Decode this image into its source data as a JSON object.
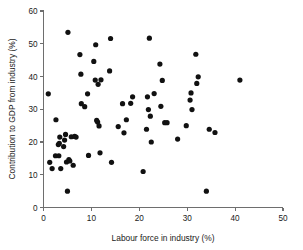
{
  "figure": {
    "background_color": "#ffffff",
    "point_color": "#111111",
    "axis_color": "#6e6e6e"
  },
  "chart_data": {
    "type": "scatter",
    "title": "",
    "xlabel": "Labour force in industry (%)",
    "ylabel": "Contribution to GDP from industry (%)",
    "xlim": [
      0,
      50
    ],
    "ylim": [
      0,
      60
    ],
    "xticks": [
      0,
      10,
      20,
      30,
      40,
      50
    ],
    "yticks": [
      0,
      10,
      20,
      30,
      40,
      50,
      60
    ],
    "xtick_labels": [
      "0",
      "10",
      "20",
      "30",
      "40",
      "50"
    ],
    "ytick_labels": [
      "0",
      "10",
      "20",
      "30",
      "40",
      "50",
      "60"
    ],
    "grid": false,
    "legend": null,
    "marker": "circle",
    "marker_size": 2.6,
    "series": [
      {
        "name": "countries",
        "points": [
          [
            1.0,
            34.7
          ],
          [
            1.3,
            13.8
          ],
          [
            1.8,
            11.9
          ],
          [
            2.5,
            15.8
          ],
          [
            2.6,
            26.8
          ],
          [
            3.1,
            19.2
          ],
          [
            3.2,
            15.8
          ],
          [
            3.3,
            19.6
          ],
          [
            3.4,
            21.5
          ],
          [
            3.6,
            11.9
          ],
          [
            4.2,
            18.6
          ],
          [
            4.4,
            20.6
          ],
          [
            4.6,
            22.3
          ],
          [
            4.8,
            13.9
          ],
          [
            5.0,
            5.0
          ],
          [
            5.1,
            53.5
          ],
          [
            5.3,
            14.6
          ],
          [
            5.5,
            14.2
          ],
          [
            5.8,
            21.6
          ],
          [
            6.2,
            12.9
          ],
          [
            6.5,
            21.7
          ],
          [
            6.8,
            21.5
          ],
          [
            7.6,
            46.7
          ],
          [
            7.8,
            40.7
          ],
          [
            7.9,
            31.7
          ],
          [
            8.6,
            30.8
          ],
          [
            9.2,
            34.7
          ],
          [
            9.4,
            15.9
          ],
          [
            10.5,
            44.6
          ],
          [
            10.8,
            38.9
          ],
          [
            10.9,
            49.7
          ],
          [
            11.1,
            26.6
          ],
          [
            11.3,
            26.1
          ],
          [
            11.4,
            37.6
          ],
          [
            11.6,
            24.9
          ],
          [
            11.8,
            16.7
          ],
          [
            12.0,
            39.0
          ],
          [
            13.8,
            41.7
          ],
          [
            14.0,
            51.6
          ],
          [
            14.2,
            13.8
          ],
          [
            15.6,
            24.7
          ],
          [
            16.5,
            31.7
          ],
          [
            16.8,
            22.8
          ],
          [
            17.3,
            26.8
          ],
          [
            18.2,
            31.8
          ],
          [
            18.6,
            33.8
          ],
          [
            20.8,
            11.0
          ],
          [
            21.5,
            23.9
          ],
          [
            21.7,
            33.8
          ],
          [
            21.9,
            29.9
          ],
          [
            22.1,
            51.7
          ],
          [
            22.3,
            27.9
          ],
          [
            22.5,
            20.0
          ],
          [
            23.1,
            34.8
          ],
          [
            24.3,
            43.8
          ],
          [
            24.5,
            30.9
          ],
          [
            24.8,
            38.8
          ],
          [
            25.3,
            25.9
          ],
          [
            25.8,
            25.9
          ],
          [
            28.0,
            20.9
          ],
          [
            29.8,
            25.0
          ],
          [
            30.6,
            32.8
          ],
          [
            30.8,
            35.0
          ],
          [
            31.0,
            29.9
          ],
          [
            31.8,
            46.8
          ],
          [
            32.0,
            37.9
          ],
          [
            32.3,
            39.9
          ],
          [
            34.0,
            5.0
          ],
          [
            34.6,
            23.9
          ],
          [
            35.8,
            22.9
          ],
          [
            41.0,
            38.9
          ]
        ]
      }
    ]
  }
}
